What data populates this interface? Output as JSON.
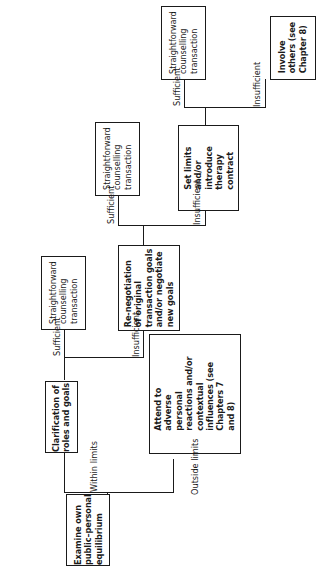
{
  "diagram": {
    "type": "flowchart",
    "orientation": "rotated-90-ccw",
    "nodes": [
      {
        "id": "examine",
        "label": "Examine own public–personal equilibrium",
        "lines": [
          "Examine own",
          "public–personal",
          "equilibrium"
        ],
        "emphasis": "bold"
      },
      {
        "id": "clarification",
        "label": "Clarification of roles and goals",
        "lines": [
          "Clarification of",
          "roles and goals"
        ],
        "emphasis": "bold"
      },
      {
        "id": "attend",
        "label": "Attend to adverse personal reactions and/or contextual influences (see Chapters 7 and 8)",
        "lines": [
          "Attend to",
          "adverse",
          "personal",
          "reactions and/or",
          "contextual",
          "influences (see",
          "Chapters 7",
          "and 8)"
        ],
        "emphasis": "bold"
      },
      {
        "id": "straightforward1",
        "label": "Straightforward counselling transaction",
        "lines": [
          "Straightforward",
          "counselling",
          "transaction"
        ],
        "emphasis": "normal"
      },
      {
        "id": "renegotiation",
        "label": "Re-negotiation of original transaction goals and/or negotiate new goals",
        "lines": [
          "Re-negotiation",
          "of original",
          "transaction goals",
          "and/or negotiate",
          "new goals"
        ],
        "emphasis": "bold"
      },
      {
        "id": "straightforward2",
        "label": "Straightforward counselling transaction",
        "lines": [
          "Straightforward",
          "counselling",
          "transaction"
        ],
        "emphasis": "normal"
      },
      {
        "id": "setlimits",
        "label": "Set limits and/or introduce therapy contract",
        "lines": [
          "Set limits",
          "and/or",
          "introduce",
          "therapy",
          "contract"
        ],
        "emphasis": "bold"
      },
      {
        "id": "straightforward3",
        "label": "Straightforward counselling transaction",
        "lines": [
          "Straightforward",
          "counselling",
          "transaction"
        ],
        "emphasis": "normal"
      },
      {
        "id": "involve",
        "label": "Involve others (see Chapter 8)",
        "lines": [
          "Involve",
          "others (see",
          "Chapter 8)"
        ],
        "emphasis": "bold"
      }
    ],
    "edge_labels": [
      {
        "id": "within",
        "text": "Within limits"
      },
      {
        "id": "outside",
        "text": "Outside limits"
      },
      {
        "id": "sufficient1",
        "text": "Sufficient"
      },
      {
        "id": "insufficient1",
        "text": "Insufficient"
      },
      {
        "id": "sufficient2",
        "text": "Sufficient"
      },
      {
        "id": "insufficient2",
        "text": "Insufficient"
      },
      {
        "id": "sufficient3",
        "text": "Sufficient"
      },
      {
        "id": "insufficient3",
        "text": "Insufficient"
      }
    ]
  }
}
